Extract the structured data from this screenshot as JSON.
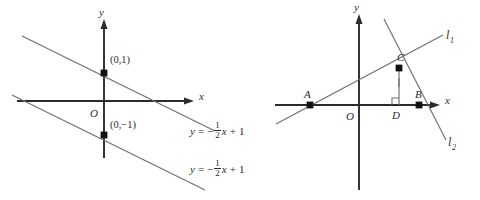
{
  "figure": {
    "panels": [
      {
        "id": "left",
        "axes": {
          "x_label": "x",
          "y_label": "y",
          "origin_label": "O"
        },
        "points": [
          {
            "name": "y-intercept-upper",
            "label": "(0,1)"
          },
          {
            "name": "y-intercept-lower",
            "label": "(0,−1)"
          }
        ],
        "equations": [
          {
            "name": "equation-upper",
            "lhs": "y",
            "equals": "=",
            "sign": "−",
            "numerator": "1",
            "denominator": "2",
            "variable": "x",
            "plus": "+",
            "constant": "1",
            "text": "y = −½x + 1"
          },
          {
            "name": "equation-lower",
            "lhs": "y",
            "equals": "=",
            "sign": "−",
            "numerator": "1",
            "denominator": "2",
            "variable": "x",
            "plus": "+",
            "constant": "1",
            "text": "y = −½x + 1"
          }
        ]
      },
      {
        "id": "right",
        "axes": {
          "x_label": "x",
          "y_label": "y",
          "origin_label": "O"
        },
        "points": [
          {
            "name": "point-a",
            "label": "A"
          },
          {
            "name": "point-b",
            "label": "B"
          },
          {
            "name": "point-c",
            "label": "C"
          },
          {
            "name": "point-d",
            "label": "D"
          }
        ],
        "lines": [
          {
            "name": "line-l1",
            "label": "l",
            "subscript": "1"
          },
          {
            "name": "line-l2",
            "label": "l",
            "subscript": "2"
          }
        ]
      }
    ],
    "colors": {
      "background": "#ffffff",
      "axis": "#2b2b2b",
      "line": "#6f6f6f",
      "dot": "#111111",
      "text": "#2b2b2b"
    }
  }
}
